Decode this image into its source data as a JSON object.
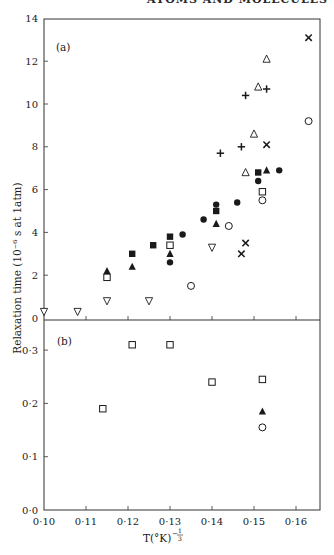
{
  "page": {
    "running_header": "ATOMS AND MOLECULES"
  },
  "chart_data": [
    {
      "panel": "(a)",
      "type": "scatter",
      "title": "",
      "xlabel": "T(°K)^-1/3",
      "ylabel": "Relaxation time (10^-6 s at 1atm)",
      "xlim": [
        0.1,
        0.165
      ],
      "ylim": [
        0,
        14
      ],
      "xticks": [
        "0·10",
        "0·11",
        "0·12",
        "0·13",
        "0·14",
        "0·15",
        "0·16"
      ],
      "yticks": [
        "0",
        "2",
        "4",
        "6",
        "8",
        "10",
        "12",
        "14"
      ],
      "grid": false,
      "legend": "none",
      "series": [
        {
          "name": "open-inverted-triangle",
          "marker": "▽",
          "points": [
            [
              0.1,
              0.3
            ],
            [
              0.108,
              0.3
            ],
            [
              0.115,
              0.8
            ],
            [
              0.125,
              0.8
            ],
            [
              0.14,
              3.3
            ]
          ]
        },
        {
          "name": "filled-square",
          "marker": "■",
          "points": [
            [
              0.121,
              3.0
            ],
            [
              0.126,
              3.4
            ],
            [
              0.13,
              3.8
            ],
            [
              0.141,
              5.0
            ],
            [
              0.151,
              6.8
            ]
          ]
        },
        {
          "name": "filled-triangle",
          "marker": "▲",
          "points": [
            [
              0.115,
              2.2
            ],
            [
              0.121,
              2.4
            ],
            [
              0.13,
              3.0
            ],
            [
              0.141,
              4.4
            ],
            [
              0.153,
              6.9
            ]
          ]
        },
        {
          "name": "open-square",
          "marker": "□",
          "points": [
            [
              0.115,
              1.9
            ],
            [
              0.13,
              3.4
            ],
            [
              0.152,
              5.9
            ]
          ]
        },
        {
          "name": "filled-circle",
          "marker": "●",
          "points": [
            [
              0.13,
              2.6
            ],
            [
              0.133,
              3.9
            ],
            [
              0.138,
              4.6
            ],
            [
              0.141,
              5.3
            ],
            [
              0.146,
              5.4
            ],
            [
              0.151,
              6.4
            ],
            [
              0.156,
              6.9
            ]
          ]
        },
        {
          "name": "open-circle",
          "marker": "○",
          "points": [
            [
              0.135,
              1.5
            ],
            [
              0.144,
              4.3
            ],
            [
              0.152,
              5.5
            ],
            [
              0.163,
              9.2
            ]
          ]
        },
        {
          "name": "open-triangle",
          "marker": "△",
          "points": [
            [
              0.148,
              6.8
            ],
            [
              0.15,
              8.6
            ],
            [
              0.151,
              10.8
            ],
            [
              0.153,
              12.1
            ]
          ]
        },
        {
          "name": "plus",
          "marker": "+",
          "points": [
            [
              0.142,
              7.7
            ],
            [
              0.147,
              8.0
            ],
            [
              0.148,
              10.4
            ],
            [
              0.153,
              10.7
            ]
          ]
        },
        {
          "name": "cross",
          "marker": "×",
          "points": [
            [
              0.147,
              3.0
            ],
            [
              0.148,
              3.5
            ],
            [
              0.153,
              8.1
            ],
            [
              0.163,
              13.1
            ]
          ]
        }
      ]
    },
    {
      "panel": "(b)",
      "type": "scatter",
      "title": "",
      "xlabel": "T(°K)^-1/3",
      "ylabel": "Relaxation time (10^-6 s at 1atm)",
      "xlim": [
        0.1,
        0.165
      ],
      "ylim": [
        0.0,
        0.357
      ],
      "xticks": [
        "0·10",
        "0·11",
        "0·12",
        "0·13",
        "0·14",
        "0·15",
        "0·16"
      ],
      "yticks": [
        "0·0",
        "0·1",
        "0·2",
        "0·3"
      ],
      "grid": false,
      "legend": "none",
      "series": [
        {
          "name": "open-square",
          "marker": "□",
          "points": [
            [
              0.114,
              0.19
            ],
            [
              0.121,
              0.31
            ],
            [
              0.13,
              0.31
            ],
            [
              0.14,
              0.24
            ],
            [
              0.152,
              0.245
            ]
          ]
        },
        {
          "name": "filled-triangle",
          "marker": "▲",
          "points": [
            [
              0.152,
              0.185
            ]
          ]
        },
        {
          "name": "open-circle",
          "marker": "○",
          "points": [
            [
              0.152,
              0.155
            ]
          ]
        }
      ]
    }
  ],
  "labels": {
    "panel_a": "(a)",
    "panel_b": "(b)",
    "ylabel": "Relaxation time (10⁻⁶ s at 1atm)",
    "xlabel_main": "T(°K)",
    "xlabel_exp_num": "1",
    "xlabel_exp_den": "3",
    "xlabel_exp_minus": "−"
  },
  "colors": {
    "ink": "#1a1a1a",
    "axis": "#333333",
    "background": "#ffffff"
  }
}
